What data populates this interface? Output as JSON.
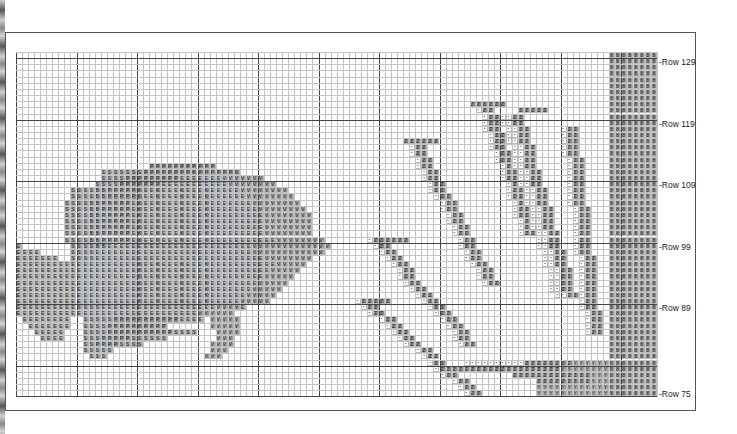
{
  "chart_title": "",
  "grid": {
    "cols": 106,
    "rows": 56,
    "first_row_number": 130,
    "last_row_number": 75,
    "cell_w": 6.05,
    "cell_h": 6.15,
    "bold_every": 10
  },
  "row_labels": [
    {
      "text": "-Row 129",
      "row": 129
    },
    {
      "text": "-Row 119",
      "row": 119
    },
    {
      "text": "-Row 109",
      "row": 109
    },
    {
      "text": "-Row 99",
      "row": 99
    },
    {
      "text": "-Row 89",
      "row": 89
    },
    {
      "text": "-Row 75",
      "row": 75
    }
  ],
  "symbols": {
    "S": {
      "fill": "#a6a6a6"
    },
    "B": {
      "fill": "#9a9a9a"
    },
    "P": {
      "fill": "#8c8c8c"
    },
    "E": {
      "fill": "#b3b3b3"
    },
    "K": {
      "fill": "#8a8a8a"
    },
    "V": {
      "fill": "#a0a0a0"
    },
    "Z": {
      "fill": "#8e8e8e"
    },
    ".": {
      "fill": "#ffffff"
    },
    "Y": {
      "fill": "#a4a4a4"
    },
    "8": {
      "fill": "#9d9d9d"
    }
  },
  "regions": {
    "fish": {
      "description": "Fish motif with symbols S, B, P, E, K, V"
    },
    "coral": {
      "description": "Seaweed/coral motif with symbols Z, dot, Y"
    },
    "border_column": {
      "description": "8-column block of symbol 8 at right edge",
      "col_start": 98,
      "col_end": 105
    }
  },
  "pattern_rows": {
    "130": "",
    "129": "",
    "128": "",
    "127": "",
    "126": "",
    "125": "",
    "124": "",
    "123": "",
    "122": "",
    "121": "",
    "120": "",
    "119": "",
    "118": "",
    "117": "",
    "116": "",
    "115": "",
    "114": "",
    "113": "",
    "112": "",
    "111": "",
    "110": "",
    "109": "",
    "108": "",
    "107": "",
    "106": "",
    "105": "",
    "104": "",
    "103": "",
    "102": "",
    "101": "",
    "100": "",
    "99": "",
    "98": "",
    "97": "",
    "96": "",
    "95": "",
    "94": "",
    "93": "",
    "92": "",
    "91": "",
    "90": "",
    "89": "",
    "88": "",
    "87": "",
    "86": "",
    "85": "",
    "84": "",
    "83": "",
    "82": "",
    "81": "",
    "80": "",
    "79": "",
    "78": "",
    "77": "",
    "76": "",
    "75": ""
  }
}
